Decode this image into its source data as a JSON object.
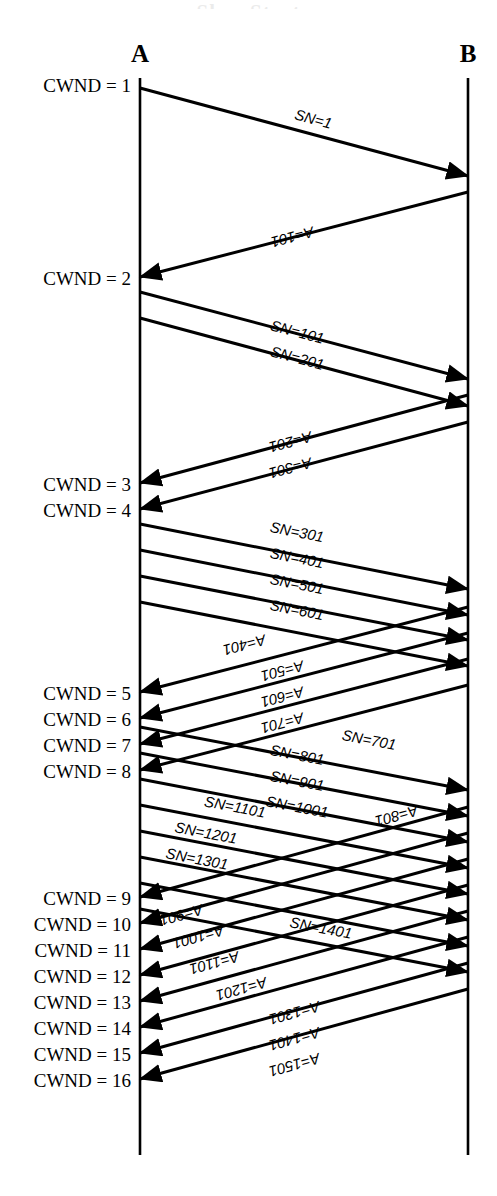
{
  "figure": {
    "cropped_heading": "Slow Start",
    "hosts": [
      {
        "name": "A",
        "x": 140,
        "top": 78,
        "bottom": 1155
      },
      {
        "name": "B",
        "x": 468,
        "top": 78,
        "bottom": 1155
      }
    ],
    "colors": {
      "ink": "#000000",
      "background": "#ffffff"
    }
  },
  "cwnd_labels": [
    {
      "text": "CWND = 1",
      "y": 85
    },
    {
      "text": "CWND = 2",
      "y": 278
    },
    {
      "text": "CWND = 3",
      "y": 484
    },
    {
      "text": "CWND = 4",
      "y": 510
    },
    {
      "text": "CWND = 5",
      "y": 693
    },
    {
      "text": "CWND = 6",
      "y": 719
    },
    {
      "text": "CWND = 7",
      "y": 745
    },
    {
      "text": "CWND = 8",
      "y": 771
    },
    {
      "text": "CWND = 9",
      "y": 898
    },
    {
      "text": "CWND = 10",
      "y": 924
    },
    {
      "text": "CWND = 11",
      "y": 950
    },
    {
      "text": "CWND = 12",
      "y": 976
    },
    {
      "text": "CWND = 13",
      "y": 1002
    },
    {
      "text": "CWND = 14",
      "y": 1028
    },
    {
      "text": "CWND = 15",
      "y": 1054
    },
    {
      "text": "CWND = 16",
      "y": 1080
    }
  ],
  "messages": [
    {
      "label": "SN=1",
      "dir": "A2B",
      "y1": 88,
      "y2": 176,
      "lx": 312,
      "ly": 124
    },
    {
      "label": "A=101",
      "dir": "B2A",
      "y1": 192,
      "y2": 277,
      "lx": 291,
      "ly": 232
    },
    {
      "label": "SN=101",
      "dir": "A2B",
      "y1": 292,
      "y2": 379,
      "lx": 296,
      "ly": 337
    },
    {
      "label": "SN=201",
      "dir": "A2B",
      "y1": 318,
      "y2": 406,
      "lx": 296,
      "ly": 363
    },
    {
      "label": "A=201",
      "dir": "B2A",
      "y1": 395,
      "y2": 483,
      "lx": 289,
      "ly": 437
    },
    {
      "label": "A=301",
      "dir": "B2A",
      "y1": 422,
      "y2": 509,
      "lx": 289,
      "ly": 463
    },
    {
      "label": "SN=301",
      "dir": "A2B",
      "y1": 524,
      "y2": 589,
      "lx": 296,
      "ly": 537
    },
    {
      "label": "SN=401",
      "dir": "A2B",
      "y1": 550,
      "y2": 615,
      "lx": 296,
      "ly": 563
    },
    {
      "label": "SN=501",
      "dir": "A2B",
      "y1": 576,
      "y2": 640,
      "lx": 296,
      "ly": 589
    },
    {
      "label": "SN=601",
      "dir": "A2B",
      "y1": 602,
      "y2": 666,
      "lx": 296,
      "ly": 615
    },
    {
      "label": "A=401",
      "dir": "B2A",
      "y1": 607,
      "y2": 692,
      "lx": 243,
      "ly": 640
    },
    {
      "label": "A=501",
      "dir": "B2A",
      "y1": 633,
      "y2": 718,
      "lx": 281,
      "ly": 666
    },
    {
      "label": "A=601",
      "dir": "B2A",
      "y1": 659,
      "y2": 744,
      "lx": 281,
      "ly": 692
    },
    {
      "label": "A=701",
      "dir": "B2A",
      "y1": 685,
      "y2": 770,
      "lx": 281,
      "ly": 718
    },
    {
      "label": "SN=701",
      "dir": "A2B",
      "y1": 727,
      "y2": 790,
      "lx": 368,
      "ly": 745
    },
    {
      "label": "SN=801",
      "dir": "A2B",
      "y1": 753,
      "y2": 816,
      "lx": 296,
      "ly": 760
    },
    {
      "label": "SN=901",
      "dir": "A2B",
      "y1": 779,
      "y2": 842,
      "lx": 296,
      "ly": 786
    },
    {
      "label": "SN=1001",
      "dir": "A2B",
      "y1": 805,
      "y2": 868,
      "lx": 296,
      "ly": 812
    },
    {
      "label": "SN=1101",
      "dir": "A2B",
      "y1": 831,
      "y2": 894,
      "lx": 234,
      "ly": 812
    },
    {
      "label": "SN=1201",
      "dir": "A2B",
      "y1": 857,
      "y2": 920,
      "lx": 205,
      "ly": 838
    },
    {
      "label": "SN=1301",
      "dir": "A2B",
      "y1": 883,
      "y2": 946,
      "lx": 196,
      "ly": 864
    },
    {
      "label": "SN=1401",
      "dir": "A2B",
      "y1": 909,
      "y2": 972,
      "lx": 320,
      "ly": 933
    },
    {
      "label": "A=801",
      "dir": "B2A",
      "y1": 807,
      "y2": 897,
      "lx": 395,
      "ly": 811
    },
    {
      "label": "A=901",
      "dir": "B2A",
      "y1": 833,
      "y2": 923,
      "lx": 180,
      "ly": 910
    },
    {
      "label": "A=1001",
      "dir": "B2A",
      "y1": 859,
      "y2": 949,
      "lx": 197,
      "ly": 932
    },
    {
      "label": "A=1101",
      "dir": "B2A",
      "y1": 885,
      "y2": 975,
      "lx": 213,
      "ly": 958
    },
    {
      "label": "A=1201",
      "dir": "B2A",
      "y1": 911,
      "y2": 1001,
      "lx": 240,
      "ly": 984
    },
    {
      "label": "A=1301",
      "dir": "B2A",
      "y1": 937,
      "y2": 1027,
      "lx": 293,
      "ly": 1008
    },
    {
      "label": "A=1401",
      "dir": "B2A",
      "y1": 963,
      "y2": 1053,
      "lx": 293,
      "ly": 1034
    },
    {
      "label": "A=1501",
      "dir": "B2A",
      "y1": 989,
      "y2": 1079,
      "lx": 293,
      "ly": 1060
    }
  ]
}
